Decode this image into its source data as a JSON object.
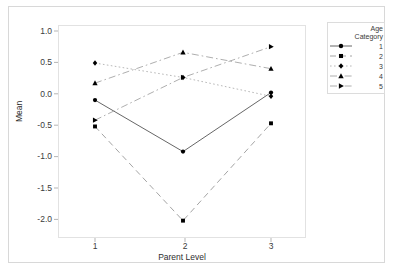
{
  "chart_data": {
    "type": "line",
    "title": "",
    "xlabel": "Parent Level",
    "ylabel": "Mean",
    "x": [
      1,
      2,
      3
    ],
    "categories": [
      "1",
      "2",
      "3"
    ],
    "xtick_labels": [
      "1",
      "2",
      "3"
    ],
    "ytick_labels": [
      "1.0",
      "0.5",
      "0.0",
      "-0.5",
      "-1.0",
      "-1.5",
      "-2.0"
    ],
    "ytick_values": [
      1.0,
      0.5,
      0.0,
      -0.5,
      -1.0,
      -1.5,
      -2.0
    ],
    "xlim": [
      0.55,
      3.45
    ],
    "ylim": [
      -2.25,
      1.1
    ],
    "grid": false,
    "legend_position": "right",
    "legend_title": "Age Category",
    "legend_title_line1": "Age",
    "legend_title_line2": "Category",
    "series": [
      {
        "name": "1",
        "label": "1",
        "marker": "circle",
        "linestyle": "solid",
        "color": "#555555",
        "values": [
          -0.1,
          -0.92,
          0.02
        ]
      },
      {
        "name": "2",
        "label": "2",
        "marker": "square",
        "linestyle": "dashed",
        "color": "#9a9a9a",
        "values": [
          -0.52,
          -2.02,
          -0.47
        ]
      },
      {
        "name": "3",
        "label": "3",
        "marker": "diamond",
        "linestyle": "dotted",
        "color": "#b0b0b0",
        "values": [
          0.49,
          0.26,
          -0.04
        ]
      },
      {
        "name": "4",
        "label": "4",
        "marker": "triangle",
        "linestyle": "dashdot",
        "color": "#a5a5a5",
        "values": [
          0.17,
          0.66,
          0.4
        ]
      },
      {
        "name": "5",
        "label": "5",
        "marker": "triangle-right",
        "linestyle": "dashdot",
        "color": "#a5a5a5",
        "values": [
          -0.42,
          0.26,
          0.75
        ]
      }
    ]
  },
  "axis": {
    "y_label": "Mean",
    "x_label": "Parent Level"
  }
}
